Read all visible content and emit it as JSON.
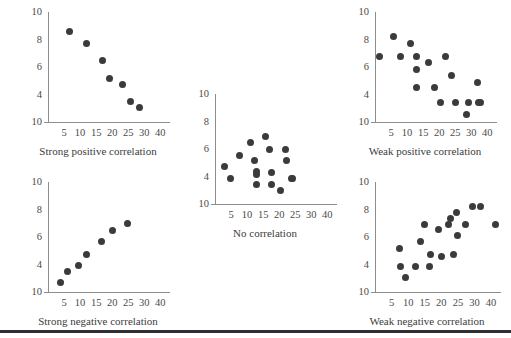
{
  "figure": {
    "background": "#ffffff",
    "dot_color": "#3b3b3b",
    "axis_color": "#8d8d8d",
    "rule_color": "#2e2e34",
    "rule_y": 330
  },
  "chart_data": [
    {
      "id": "strong-positive",
      "type": "scatter",
      "title": "Strong positive correlation",
      "xlabel": "",
      "ylabel": "",
      "xticks": [
        5,
        10,
        15,
        20,
        25,
        30,
        40
      ],
      "yticks": [
        10,
        8,
        6,
        4,
        10
      ],
      "xlim": [
        0,
        40
      ],
      "ylim": [
        2,
        11
      ],
      "grid": false,
      "legend": "none",
      "x": [
        7,
        12.5,
        18,
        20,
        24.5,
        27,
        30
      ],
      "y": [
        9.4,
        8.4,
        7.0,
        5.6,
        5.1,
        3.7,
        3.2
      ]
    },
    {
      "id": "no-correlation",
      "type": "scatter",
      "title": "No correlation",
      "xlabel": "",
      "ylabel": "",
      "xticks": [
        5,
        10,
        15,
        20,
        25,
        30,
        40
      ],
      "yticks": [
        10,
        8,
        6,
        4,
        10
      ],
      "xlim": [
        0,
        40
      ],
      "ylim": [
        2,
        11
      ],
      "grid": false,
      "legend": "none",
      "x": [
        3,
        5,
        8,
        11.5,
        13,
        13.5,
        13.5,
        13.5,
        16.5,
        18,
        18.5,
        18.5,
        21.5,
        23,
        23.5,
        25,
        25.5
      ],
      "y": [
        5.1,
        4.1,
        6.0,
        7.0,
        5.6,
        4.7,
        4.4,
        3.6,
        7.5,
        6.5,
        4.6,
        3.6,
        3.1,
        6.5,
        5.6,
        4.1,
        4.1
      ]
    },
    {
      "id": "weak-positive",
      "type": "scatter",
      "title": "Weak positive correlation",
      "xlabel": "",
      "ylabel": "",
      "xticks": [
        5,
        10,
        15,
        20,
        25,
        30,
        40
      ],
      "yticks": [
        10,
        8,
        6,
        4,
        10
      ],
      "xlim": [
        0,
        40
      ],
      "ylim": [
        2,
        11
      ],
      "grid": false,
      "legend": "none",
      "x": [
        1.5,
        6,
        8.5,
        11.5,
        13.5,
        13.5,
        13.5,
        17.5,
        19.5,
        21.5,
        23,
        25,
        26.5,
        30,
        30.5,
        33.5,
        34,
        34.5
      ],
      "y": [
        7.4,
        9.0,
        7.4,
        8.4,
        7.4,
        6.3,
        4.8,
        6.9,
        4.8,
        3.6,
        7.4,
        5.8,
        3.6,
        2.6,
        3.6,
        5.2,
        3.6,
        3.6
      ]
    },
    {
      "id": "strong-negative",
      "type": "scatter",
      "title": "Strong negative correlation",
      "xlabel": "",
      "ylabel": "",
      "xticks": [
        5,
        10,
        15,
        20,
        25,
        30,
        40
      ],
      "yticks": [
        10,
        8,
        6,
        4,
        10
      ],
      "xlim": [
        0,
        40
      ],
      "ylim": [
        2,
        11
      ],
      "grid": false,
      "legend": "none",
      "x": [
        4,
        6.5,
        10,
        12.5,
        17.5,
        21,
        26
      ],
      "y": [
        2.8,
        3.7,
        4.2,
        5.1,
        6.1,
        7.0,
        7.6
      ]
    },
    {
      "id": "weak-negative",
      "type": "scatter",
      "title": "Weak negative correlation",
      "xlabel": "",
      "ylabel": "",
      "xticks": [
        5,
        10,
        15,
        20,
        25,
        30,
        40
      ],
      "yticks": [
        10,
        8,
        6,
        4,
        10
      ],
      "xlim": [
        0,
        42
      ],
      "ylim": [
        2,
        11
      ],
      "grid": false,
      "legend": "none",
      "x": [
        8,
        8.5,
        10,
        13.5,
        15,
        16.5,
        18,
        18.5,
        21,
        22,
        24.5,
        25,
        26,
        27,
        27.5,
        30,
        32.5,
        35,
        40
      ],
      "y": [
        5.6,
        4.1,
        3.2,
        4.1,
        6.1,
        7.5,
        4.1,
        5.1,
        7.1,
        4.9,
        7.5,
        8.0,
        5.1,
        8.5,
        6.6,
        7.5,
        9.0,
        9.0,
        7.5
      ]
    }
  ],
  "panels": [
    {
      "ref": 0,
      "left": 18,
      "top": 8,
      "plot_w": 122,
      "plot_h": 110,
      "caption_top": 142
    },
    {
      "ref": 1,
      "left": 185,
      "top": 90,
      "plot_w": 122,
      "plot_h": 110,
      "caption_top": 224
    },
    {
      "ref": 2,
      "left": 345,
      "top": 8,
      "plot_w": 122,
      "plot_h": 110,
      "caption_top": 142
    },
    {
      "ref": 3,
      "left": 18,
      "top": 178,
      "plot_w": 122,
      "plot_h": 110,
      "caption_top": 312
    },
    {
      "ref": 4,
      "left": 345,
      "top": 178,
      "plot_w": 126,
      "plot_h": 110,
      "caption_top": 312
    }
  ]
}
